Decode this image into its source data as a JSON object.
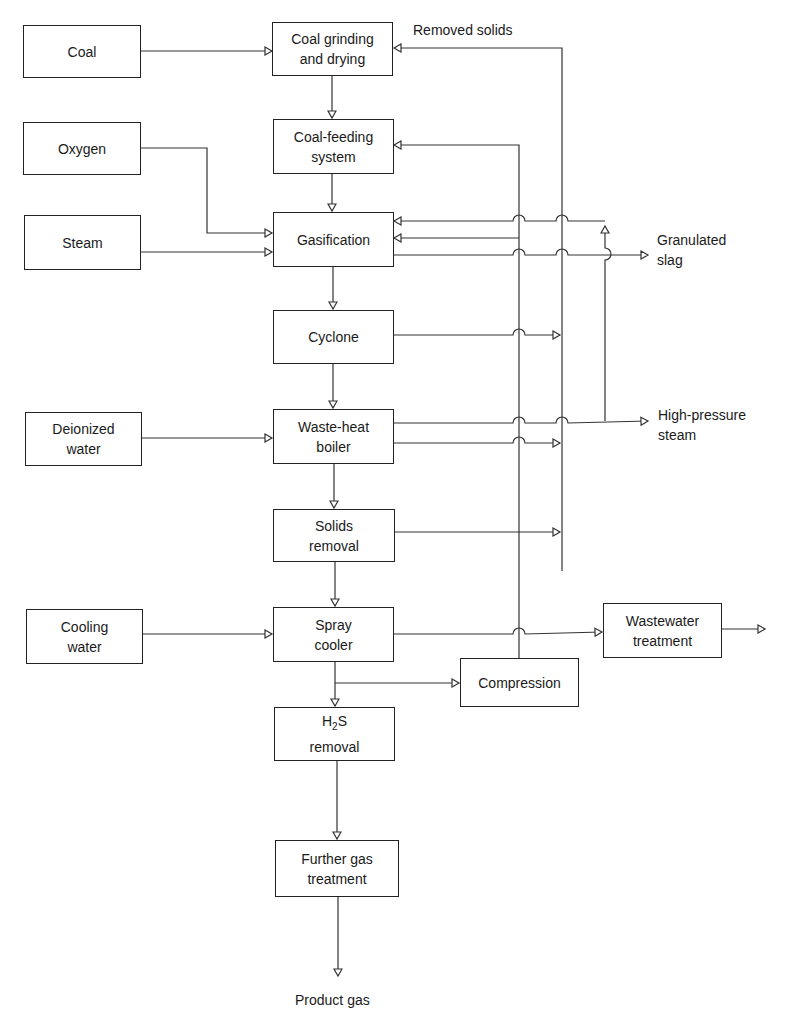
{
  "diagram": {
    "type": "process-flow",
    "inputs": {
      "coal": "Coal",
      "oxygen": "Oxygen",
      "steam": "Steam",
      "deionized_water": "Deionized\nwater",
      "cooling_water": "Cooling\nwater"
    },
    "process": {
      "coal_grinding": "Coal grinding\nand drying",
      "coal_feeding": "Coal-feeding\nsystem",
      "gasification": "Gasification",
      "cyclone": "Cyclone",
      "waste_heat_boiler": "Waste-heat\nboiler",
      "solids_removal": "Solids\nremoval",
      "spray_cooler": "Spray\ncooler",
      "h2s_prefix": "H",
      "h2s_sub": "2",
      "h2s_suffix": "S",
      "h2s_line2": "removal",
      "further_gas": "Further  gas\ntreatment",
      "compression": "Compression",
      "wastewater": "Wastewater\ntreatment"
    },
    "outputs": {
      "removed_solids": "Removed solids",
      "granulated_slag": "Granulated\nslag",
      "high_pressure_steam": "High-pressure\nsteam",
      "product_gas": "Product gas"
    },
    "line_color": "#333333"
  }
}
